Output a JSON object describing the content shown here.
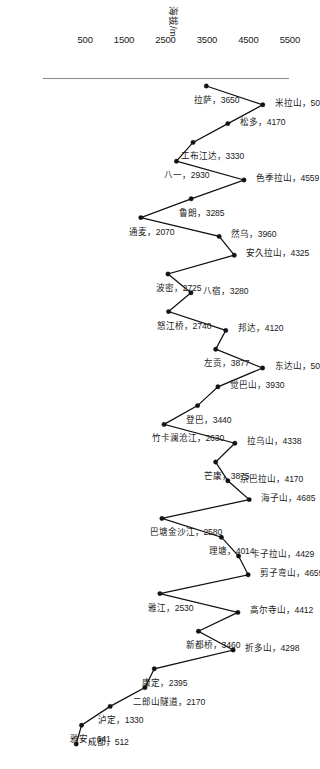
{
  "chart_data": {
    "type": "line",
    "title": "",
    "xlabel": "",
    "ylabel": "海拔/m",
    "ylim": [
      0,
      5500
    ],
    "yticks": [
      5500,
      4500,
      3500,
      2500,
      1500,
      500
    ],
    "ytick_labels": [
      "5500",
      "4500",
      "3500",
      "2500",
      "1500",
      "500"
    ],
    "grid": false,
    "legend": "none",
    "categories": [
      "拉萨",
      "米拉山",
      "松多",
      "工布江达",
      "八一",
      "色季拉山",
      "鲁朗",
      "通麦",
      "然乌",
      "安久拉山",
      "波密",
      "八宿",
      "怒江桥",
      "邦达",
      "左贡",
      "东达山",
      "觉巴山",
      "登巴",
      "竹卡澜沧江",
      "拉乌山",
      "芒康",
      "宗巴拉山",
      "海子山",
      "巴塘金沙江",
      "理塘",
      "卡子拉山",
      "剪子弯山",
      "雅江",
      "高尔寺山",
      "新都桥",
      "折多山",
      "康定",
      "二郎山隧道",
      "泸定",
      "雅安",
      "成都"
    ],
    "values": [
      3650,
      5013,
      4170,
      3330,
      2930,
      4559,
      3285,
      2070,
      3960,
      4325,
      2725,
      3280,
      2740,
      4120,
      3877,
      5008,
      3930,
      3440,
      2630,
      4338,
      3875,
      4170,
      4685,
      2580,
      4014,
      4429,
      4659,
      2530,
      4412,
      3460,
      4298,
      2395,
      2170,
      1330,
      641,
      512
    ],
    "point_labels": [
      "拉萨，3650",
      "米拉山，5013",
      "松多，4170",
      "工布江达，3330",
      "八一，2930",
      "色季拉山，4559",
      "鲁朗，3285",
      "通麦，2070",
      "然乌，3960",
      "安久拉山，4325",
      "波密，2725",
      "八宿，3280",
      "怒江桥，2740",
      "邦达，4120",
      "左贡，3877",
      "东达山，5008",
      "觉巴山，3930",
      "登巴，3440",
      "竹卡澜沧江，2630",
      "拉乌山，4338",
      "芒康，3875",
      "宗巴拉山，4170",
      "海子山，4685",
      "巴塘金沙江，2580",
      "理塘，4014",
      "卡子拉山，4429",
      "剪子弯山，4659",
      "雅江，2530",
      "高尔寺山，4412",
      "新都桥，3460",
      "折多山，4298",
      "康定，2395",
      "二郎山隧道，2170",
      "泸定，1330",
      "雅安，641",
      "成都，512"
    ],
    "line_color": "#111111",
    "marker_color": "#111111",
    "axis_color": "#8a8a8a"
  }
}
